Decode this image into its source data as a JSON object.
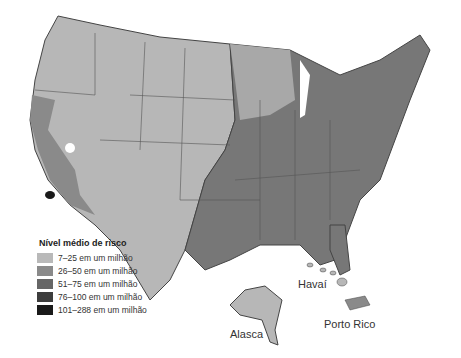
{
  "legend": {
    "title": "Nível médio de risco",
    "items": [
      {
        "label": "7–25 em um milhão",
        "color": "#b9b9b9"
      },
      {
        "label": "26–50 em um milhão",
        "color": "#8a8a8a"
      },
      {
        "label": "51–75 em um milhão",
        "color": "#666666"
      },
      {
        "label": "76–100 em um milhão",
        "color": "#3d3d3d"
      },
      {
        "label": "101–288 em um milhão",
        "color": "#1a1a1a"
      }
    ]
  },
  "labels": {
    "hawaii": "Havaí",
    "alaska": "Alasca",
    "puerto_rico": "Porto Rico"
  }
}
